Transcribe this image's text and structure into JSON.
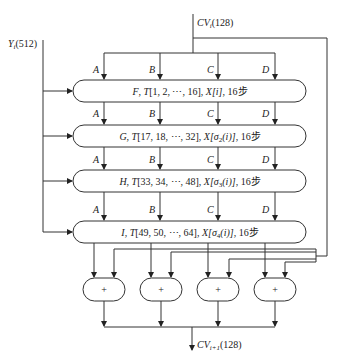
{
  "diagram": {
    "type": "MD5 compression function flow",
    "input_block": {
      "symbol": "Y",
      "sub": "i",
      "bits": "(512)"
    },
    "input_cv": {
      "symbol": "CV",
      "sub": "i",
      "bits": "(128)"
    },
    "output_cv": {
      "symbol": "CV",
      "sub": "i+1",
      "bits": "(128)"
    },
    "registers": [
      "A",
      "B",
      "C",
      "D"
    ],
    "rounds": [
      {
        "func": "F",
        "t": "T[1, 2, ⋯, 16]",
        "x": "X[i]",
        "x_pre": "X[",
        "x_sigma": "",
        "x_post": "i]",
        "steps": "16步"
      },
      {
        "func": "G",
        "t": "T[17, 18, ⋯, 32]",
        "x_pre": "X[",
        "x_sigma": "σ",
        "x_sigma_sub": "2",
        "x_post": "(i)]",
        "steps": "16步"
      },
      {
        "func": "H",
        "t": "T[33, 34, ⋯, 48]",
        "x_pre": "X[",
        "x_sigma": "σ",
        "x_sigma_sub": "3",
        "x_post": "(i)]",
        "steps": "16步"
      },
      {
        "func": "I",
        "t": "T[49, 50, ⋯, 64]",
        "x_pre": "X[",
        "x_sigma": "σ",
        "x_sigma_sub": "4",
        "x_post": "(i)]",
        "steps": "16步"
      }
    ],
    "adders": [
      "+",
      "+",
      "+",
      "+"
    ]
  }
}
